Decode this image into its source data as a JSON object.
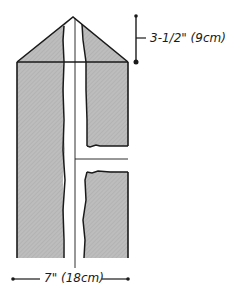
{
  "diagram": {
    "colors": {
      "fill": "#b8b8b8",
      "stroke": "#1a1a1a",
      "background": "#ffffff"
    },
    "dimensions": {
      "height_label": "3-1/2\" (9cm)",
      "width_label": "7\" (18cm)"
    },
    "parts": [
      {
        "name": "triangle-top",
        "description": "pointed top section"
      },
      {
        "name": "body-rectangle",
        "description": "main rectangular body"
      },
      {
        "name": "center-strip",
        "description": "vertical white strip down the middle"
      },
      {
        "name": "side-opening",
        "description": "horizontal white band on right side"
      }
    ]
  }
}
